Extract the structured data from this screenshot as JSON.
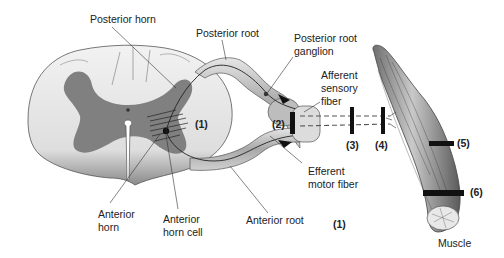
{
  "diagram": {
    "labels": {
      "posterior_horn": "Posterior horn",
      "posterior_root": "Posterior root",
      "posterior_root_ganglion_1": "Posterior root",
      "posterior_root_ganglion_2": "ganglion",
      "afferent_1": "Afferent",
      "afferent_2": "sensory",
      "afferent_3": "fiber",
      "efferent_1": "Efferent",
      "efferent_2": "motor fiber",
      "anterior_root": "Anterior root",
      "anterior_horn_1": "Anterior",
      "anterior_horn_2": "horn",
      "anterior_horn_cell_1": "Anterior",
      "anterior_horn_cell_2": "horn cell",
      "muscle": "Muscle"
    },
    "sites": {
      "s1_cord": "(1)",
      "s1_bottom": "(1)",
      "s2": "(2)",
      "s3": "(3)",
      "s4": "(4)",
      "s5": "(5)",
      "s6": "(6)"
    },
    "colors": {
      "white_matter": "#d9d9d9",
      "gray_matter": "#7a7a7a",
      "root": "#b8b8b8",
      "muscle": "#8f8f8f",
      "bar": "#111111",
      "text": "#222222"
    }
  }
}
